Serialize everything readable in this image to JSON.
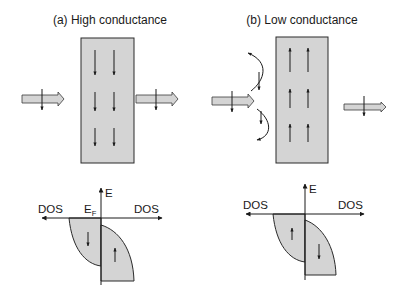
{
  "panels": [
    {
      "id": "a",
      "title": "(a) High conductance",
      "layer_magnetization": "down",
      "incoming_spin": "down",
      "outgoing_spin": "down",
      "transmitted": true,
      "dos": {
        "axis_label_energy": "E",
        "axis_label_left": "DOS",
        "axis_label_right": "DOS",
        "fermi_label": "E",
        "fermi_subscript": "F",
        "left_band_spin": "down",
        "right_band_spin": "up"
      }
    },
    {
      "id": "b",
      "title": "(b) Low conductance",
      "layer_magnetization": "up",
      "incoming_spin": "down",
      "outgoing_spin": "down",
      "transmitted": false,
      "reflected": true,
      "dos": {
        "axis_label_energy": "E",
        "axis_label_left": "DOS",
        "axis_label_right": "DOS",
        "left_band_spin": "up",
        "right_band_spin": "down"
      }
    }
  ],
  "colors": {
    "fill": "#d4d4d4",
    "stroke": "#2a2a2a",
    "background": "#ffffff"
  }
}
